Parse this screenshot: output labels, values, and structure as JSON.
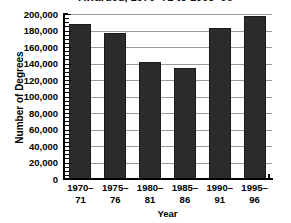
{
  "chart_data": {
    "type": "bar",
    "title": "Awarded, 1970–71 to 1995–96",
    "title_clipped": true,
    "categories": [
      "1970–\n71",
      "1975–\n76",
      "1980–\n81",
      "1985–\n86",
      "1990–\n91",
      "1995–\n96"
    ],
    "category_lines": [
      [
        "1970–",
        "71"
      ],
      [
        "1975–",
        "76"
      ],
      [
        "1980–",
        "81"
      ],
      [
        "1985–",
        "86"
      ],
      [
        "1990–",
        "91"
      ],
      [
        "1995–",
        "96"
      ]
    ],
    "values": [
      188000,
      177000,
      142000,
      134000,
      183000,
      198000
    ],
    "xlabel": "Year",
    "ylabel": "Number of Degrees",
    "ylim": [
      0,
      200000
    ],
    "ytick_step": 20000,
    "yticks": [
      200000,
      180000,
      160000,
      140000,
      120000,
      100000,
      80000,
      60000,
      40000,
      20000,
      0
    ],
    "ytick_labels": [
      "200,000",
      "180,000",
      "160,000",
      "140,000",
      "120,000",
      "100,000",
      "80,000",
      "60,000",
      "40,000",
      "20,000",
      "0"
    ],
    "minor_tick_step": 5000,
    "grid": true,
    "grid_axis": "y",
    "legend": null,
    "legend_position": "none",
    "bar_color": "#2b2b2b",
    "grid_color": "#9a9a9a",
    "axis_color": "#000000",
    "background_color": "#ffffff"
  }
}
